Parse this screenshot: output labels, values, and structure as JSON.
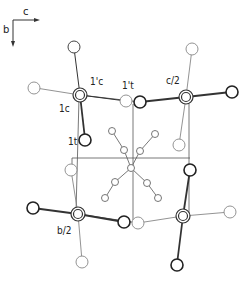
{
  "figure": {
    "type": "crystal-structure-projection",
    "axes": {
      "horizontal_label": "c",
      "vertical_label": "b"
    },
    "labels": {
      "one_c": "1c",
      "one_prime_c": "1'c",
      "one_t": "1t",
      "one_prime_t": "1't",
      "c_half": "c/2",
      "b_half": "b/2"
    },
    "colors": {
      "line": "#333333",
      "light_atom": "#888888",
      "background": "#ffffff"
    }
  }
}
